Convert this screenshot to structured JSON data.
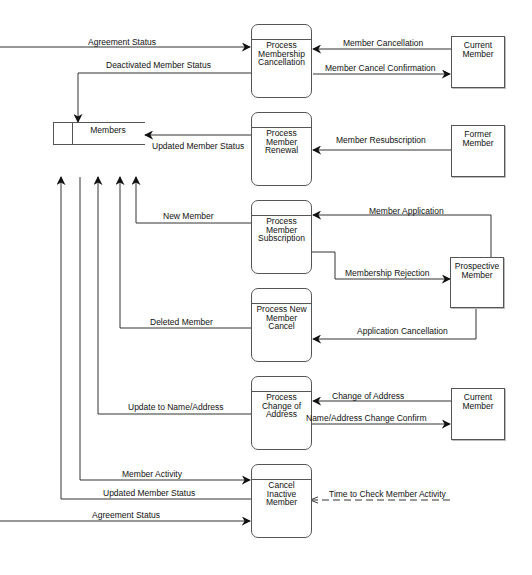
{
  "diagram": {
    "type": "data-flow-diagram",
    "data_store": {
      "label": "Members"
    },
    "processes": [
      {
        "id": "p1",
        "label": [
          "Process",
          "Membership",
          "Cancellation"
        ]
      },
      {
        "id": "p2",
        "label": [
          "Process",
          "Member",
          "Renewal"
        ]
      },
      {
        "id": "p3",
        "label": [
          "Process",
          "Member",
          "Subscription"
        ]
      },
      {
        "id": "p4",
        "label": [
          "Process New",
          "Member",
          "Cancel"
        ]
      },
      {
        "id": "p5",
        "label": [
          "Process",
          "Change of",
          "Address"
        ]
      },
      {
        "id": "p6",
        "label": [
          "Cancel",
          "Inactive",
          "Member"
        ]
      }
    ],
    "external_entities": [
      {
        "id": "e1",
        "label": [
          "Current",
          "Member"
        ]
      },
      {
        "id": "e2",
        "label": [
          "Former",
          "Member"
        ]
      },
      {
        "id": "e3",
        "label": [
          "Prospective",
          "Member"
        ]
      },
      {
        "id": "e4",
        "label": [
          "Current",
          "Member"
        ]
      }
    ],
    "flows": {
      "agreement_status_top": "Agreement Status",
      "deactivated_member_status": "Deactivated Member Status",
      "member_cancellation": "Member Cancellation",
      "member_cancel_confirmation": "Member Cancel Confirmation",
      "updated_member_status_renewal": "Updated Member Status",
      "member_resubscription": "Member Resubscription",
      "new_member": "New Member",
      "member_application": "Member Application",
      "membership_rejection": "Membership Rejection",
      "deleted_member": "Deleted Member",
      "application_cancellation": "Application Cancellation",
      "update_name_address": "Update to Name/Address",
      "change_of_address": "Change of Address",
      "name_address_change_confirm": "Name/Address Change Confirm",
      "member_activity": "Member Activity",
      "updated_member_status_inactive": "Updated Member Status",
      "agreement_status_bottom": "Agreement Status",
      "time_to_check": "Time to Check Member Activity"
    }
  }
}
